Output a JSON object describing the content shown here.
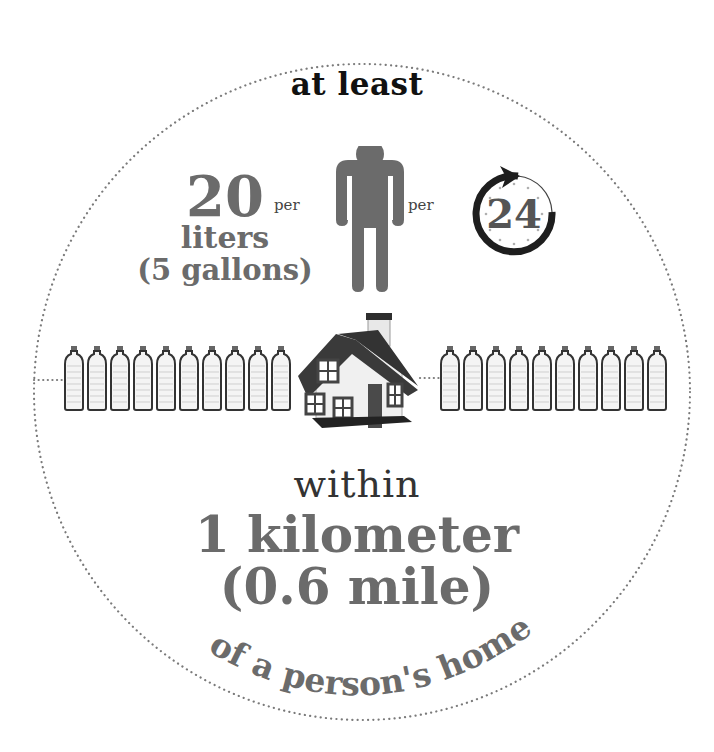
{
  "infographic": {
    "top_label": "at least",
    "amount_number": "20",
    "amount_unit": "liters",
    "amount_alt": "(5 gallons)",
    "per_1": "per",
    "per_2": "per",
    "clock_number": "24",
    "within_label": "within",
    "distance_primary": "1 kilometer",
    "distance_alt": "(0.6 mile)",
    "bottom_arc_text": "of a person's home",
    "bottles_left_count": 10,
    "bottles_right_count": 10,
    "icons": {
      "person": "person-icon",
      "clock": "clock-24h-icon",
      "house": "house-icon",
      "bottle": "water-bottle-icon"
    },
    "colors": {
      "text_dark": "#111111",
      "text_gray": "#6b6b6b",
      "dotted_circle": "#7a7a7a",
      "person": "#6b6b6b",
      "house_roof": "#3a3a3a"
    }
  }
}
